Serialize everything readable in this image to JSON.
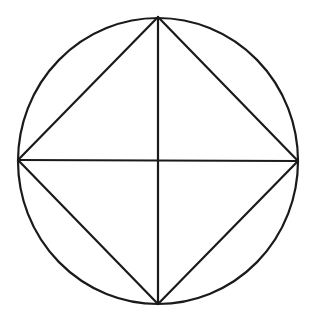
{
  "diagram": {
    "stroke_color": "#1a1a1a",
    "stroke_width": 2.2,
    "background": "#ffffff",
    "circle": {
      "cx": 158,
      "cy": 161,
      "rx": 140,
      "ry": 143
    },
    "vertices": {
      "top": {
        "x": 158,
        "y": 17
      },
      "right": {
        "x": 298,
        "y": 161
      },
      "bottom": {
        "x": 158,
        "y": 304
      },
      "left": {
        "x": 18,
        "y": 160
      }
    },
    "segments": [
      {
        "name": "square-edge-top-right",
        "from": "top",
        "to": "right"
      },
      {
        "name": "square-edge-right-bottom",
        "from": "right",
        "to": "bottom"
      },
      {
        "name": "square-edge-bottom-left",
        "from": "bottom",
        "to": "left"
      },
      {
        "name": "square-edge-left-top",
        "from": "left",
        "to": "top"
      },
      {
        "name": "vertical-diameter",
        "from": "top",
        "to": "bottom"
      },
      {
        "name": "horizontal-diameter",
        "from": "left",
        "to": "right"
      }
    ]
  }
}
